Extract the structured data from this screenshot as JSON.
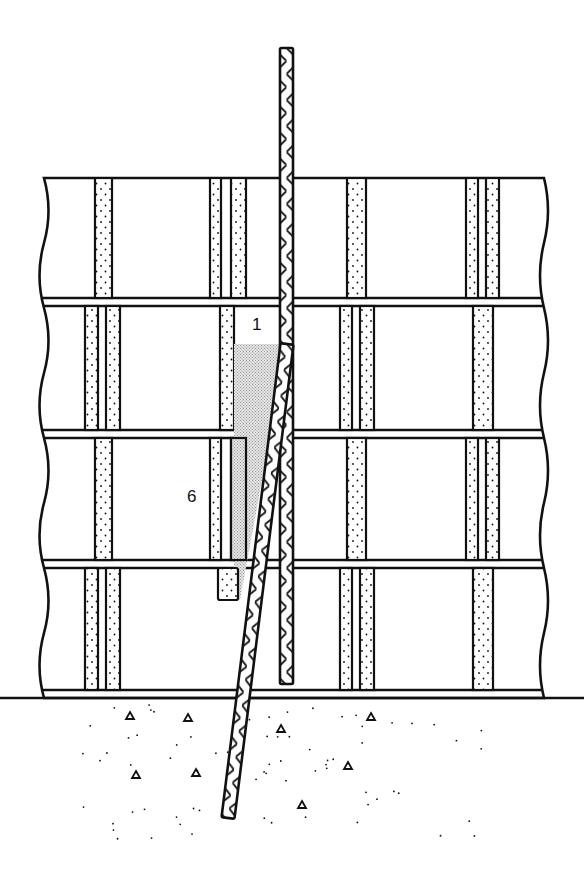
{
  "figure": {
    "type": "technical-illustration",
    "colors": {
      "ink": "#111111",
      "paper": "#ffffff",
      "shade": "#bdbdbd"
    }
  },
  "labels": [
    {
      "id": "label-1",
      "text": "1",
      "x": 252,
      "y": 316
    },
    {
      "id": "label-6",
      "text": "6",
      "x": 187,
      "y": 488
    }
  ],
  "wall": {
    "left": 38,
    "right": 548,
    "top": 178,
    "courses": [
      {
        "top": 178,
        "bottom": 298
      },
      {
        "top": 306,
        "bottom": 430
      },
      {
        "top": 438,
        "bottom": 560
      },
      {
        "top": 568,
        "bottom": 690
      }
    ],
    "base_line": 698
  },
  "joints": {
    "course_0": [
      {
        "x": 95,
        "w": 17
      },
      {
        "x": 210,
        "w": 11
      },
      {
        "x": 231,
        "w": 15
      },
      {
        "x": 347,
        "w": 19
      },
      {
        "x": 466,
        "w": 12
      },
      {
        "x": 486,
        "w": 13
      }
    ],
    "course_1": [
      {
        "x": 85,
        "w": 13
      },
      {
        "x": 106,
        "w": 14
      },
      {
        "x": 220,
        "w": 14
      },
      {
        "x": 340,
        "w": 12
      },
      {
        "x": 360,
        "w": 14
      },
      {
        "x": 473,
        "w": 20
      }
    ],
    "course_2": [
      {
        "x": 95,
        "w": 17
      },
      {
        "x": 210,
        "w": 11
      },
      {
        "x": 231,
        "w": 15
      },
      {
        "x": 347,
        "w": 19
      },
      {
        "x": 466,
        "w": 12
      },
      {
        "x": 486,
        "w": 13
      }
    ],
    "course_3": [
      {
        "x": 85,
        "w": 13
      },
      {
        "x": 106,
        "w": 14
      },
      {
        "x": 340,
        "w": 12
      },
      {
        "x": 360,
        "w": 14
      },
      {
        "x": 473,
        "w": 20
      }
    ]
  },
  "rods": {
    "vertical": {
      "label": "1",
      "x": 280,
      "w": 13,
      "top": 48,
      "bottom": 684
    },
    "angled": {
      "label": "6",
      "top_x": 287,
      "top_y": 344,
      "bottom_x": 228,
      "bottom_y": 818,
      "w": 13
    }
  },
  "ground": {
    "top": 705,
    "bottom": 840
  }
}
